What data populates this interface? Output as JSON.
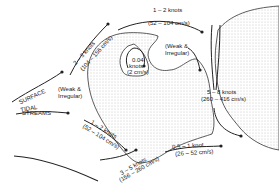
{
  "diagram": {
    "title_labels": [
      "SURFACE",
      "TIDAL",
      "STREAMS"
    ],
    "annotations": {
      "nw_flow": {
        "speed": "2 – 3 knots",
        "metric": "(104 – 156 cm/s)"
      },
      "north_flow": {
        "speed": "1 – 2 knots",
        "metric": "(52 – 104 cm/s)"
      },
      "eddy_center": {
        "speed": "0.04",
        "unit": "knots",
        "metric": "(2 cm/s)"
      },
      "weak_west": {
        "line1": "(Weak &",
        "line2": "Irregular)"
      },
      "weak_east": {
        "line1": "(Weak &",
        "line2": "Irregular)"
      },
      "channel_flow": {
        "speed": "5 – 8 knots",
        "metric": "(260 – 416 cm/s)"
      },
      "sw_flow": {
        "speed": "1 – 2 knots",
        "metric": "(52 – 104 cm/s)"
      },
      "south_flow": {
        "speed": "3 – 5 knots",
        "metric": "(156 – 260 cm/s)"
      },
      "se_flow": {
        "speed": "0.5 – 1 knot",
        "metric": "(26 – 52 cm/s)"
      }
    },
    "colors": {
      "ink": "#222222",
      "stipple": "#9a9a9a",
      "background": "#ffffff"
    }
  }
}
